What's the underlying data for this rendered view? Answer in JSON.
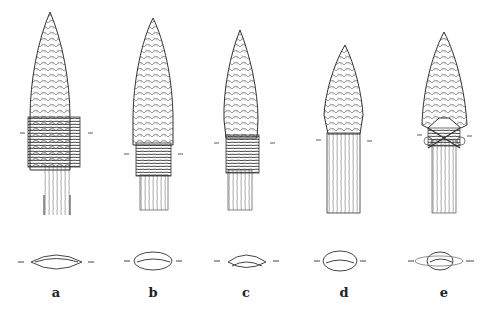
{
  "figure": {
    "specimens": [
      {
        "id": "a",
        "label": "a",
        "cx": 50,
        "haft": "wrapped binding, split shaft"
      },
      {
        "id": "b",
        "label": "b",
        "cx": 153,
        "haft": "wrapped binding"
      },
      {
        "id": "c",
        "label": "c",
        "cx": 246,
        "haft": "wrapped binding"
      },
      {
        "id": "d",
        "label": "d",
        "cx": 344,
        "haft": "socketed shaft, no binding"
      },
      {
        "id": "e",
        "label": "e",
        "cx": 444,
        "haft": "cross-lashed binding"
      }
    ]
  },
  "colors": {
    "ink": "#333333",
    "background": "#ffffff"
  }
}
